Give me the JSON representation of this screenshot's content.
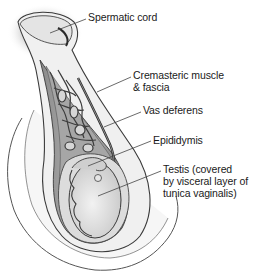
{
  "diagram": {
    "style": "grayscale illustration",
    "labels": [
      {
        "id": "spermatic-cord",
        "lines": [
          "Spermatic cord"
        ],
        "x": 88,
        "y": 11,
        "leader": [
          [
            86,
            19
          ],
          [
            50,
            33
          ]
        ]
      },
      {
        "id": "cremasteric-muscle",
        "lines": [
          "Cremasteric muscle",
          "& fascia"
        ],
        "x": 133,
        "y": 69,
        "leader": [
          [
            131,
            77
          ],
          [
            97,
            92
          ]
        ]
      },
      {
        "id": "vas-deferens",
        "lines": [
          "Vas deferens"
        ],
        "x": 143,
        "y": 104,
        "leader": [
          [
            141,
            112
          ],
          [
            104,
            127
          ]
        ]
      },
      {
        "id": "epididymis",
        "lines": [
          "Epididymis"
        ],
        "x": 153,
        "y": 134,
        "leader": [
          [
            151,
            141
          ],
          [
            88,
            166
          ]
        ]
      },
      {
        "id": "testis",
        "lines": [
          "Testis (covered",
          "by visceral layer of",
          "tunica vaginalis)"
        ],
        "x": 163,
        "y": 163,
        "leader": [
          [
            161,
            171
          ],
          [
            98,
            196
          ]
        ]
      }
    ],
    "colors": {
      "text": "#1a1a1a",
      "leader": "#444444",
      "outline": "#3a3a3a",
      "skin": "#f4f4f4",
      "muscle": "#9a9a9a",
      "testis": "#e8e8e8",
      "dark_layer": "#6e6e6e"
    }
  }
}
